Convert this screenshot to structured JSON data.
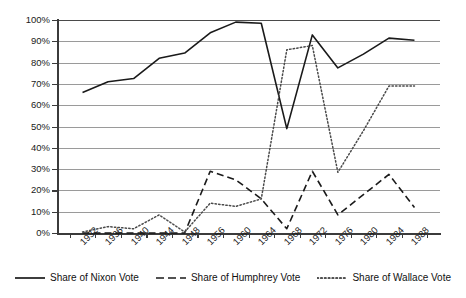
{
  "chart_data": {
    "type": "line",
    "title": "",
    "subtitle": "",
    "xlabel": "",
    "ylabel": "",
    "ylim": [
      0,
      100
    ],
    "ytick_labels": [
      "0%",
      "10%",
      "20%",
      "30%",
      "40%",
      "50%",
      "60%",
      "70%",
      "80%",
      "90%",
      "100%"
    ],
    "ytick_values": [
      0,
      10,
      20,
      30,
      40,
      50,
      60,
      70,
      80,
      90,
      100
    ],
    "grid": "horizontal",
    "legend_position": "bottom",
    "categories": [
      "1932",
      "1936",
      "1940",
      "1944",
      "1948",
      "1956",
      "1960",
      "1964",
      "1968",
      "1972",
      "1976",
      "1980",
      "1984",
      "1988"
    ],
    "series": [
      {
        "name": "Share of Nixon Vote",
        "style": "solid",
        "color": "#1a1a1a",
        "values": [
          66,
          71,
          72.5,
          82,
          84.5,
          94,
          99,
          98.5,
          49,
          93,
          77.5,
          84,
          91.5,
          90.5
        ]
      },
      {
        "name": "Share of Humphrey Vote",
        "style": "dashed",
        "color": "#1a1a1a",
        "values": [
          0,
          0,
          0,
          0,
          0,
          29,
          25,
          16,
          2,
          29,
          8.5,
          18,
          27.5,
          12
        ]
      },
      {
        "name": "Share of Wallace Vote",
        "style": "dotted",
        "color": "#4a4a4a",
        "values": [
          0.5,
          3,
          2,
          8.5,
          0.5,
          14,
          12.5,
          16,
          86,
          88,
          28.5,
          48,
          69,
          69
        ]
      }
    ]
  },
  "legend": {
    "entries": [
      {
        "label": "Share of Nixon Vote",
        "style": "solid"
      },
      {
        "label": "Share of Humphrey Vote",
        "style": "dashed"
      },
      {
        "label": "Share of Wallace Vote",
        "style": "dotted"
      }
    ]
  }
}
